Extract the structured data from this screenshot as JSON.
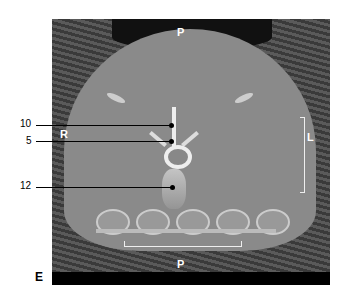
{
  "figure": {
    "orientation_labels": {
      "top": "P",
      "left": "R",
      "right": "L",
      "bottom": "P"
    },
    "callouts": [
      {
        "number": "10"
      },
      {
        "number": "5"
      },
      {
        "number": "12"
      }
    ],
    "panel_label": "E"
  }
}
